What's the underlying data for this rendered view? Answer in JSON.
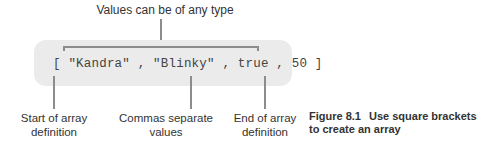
{
  "diagram": {
    "top_callout": "Values can be of any type",
    "code": "[ \"Kandra\" , \"Blinky\" , true , 50 ]",
    "bottom_callouts": [
      {
        "line1": "Start of array",
        "line2": "definition"
      },
      {
        "line1": "Commas separate",
        "line2": "values"
      },
      {
        "line1": "End of array",
        "line2": "definition"
      }
    ]
  },
  "caption": {
    "figure_number": "Figure 8.1",
    "line1": "Use square brackets",
    "line2": "to create an array"
  },
  "colors": {
    "box_fill": "#ebebeb",
    "connector_line": "#8c8c8c",
    "text": "#333333"
  }
}
